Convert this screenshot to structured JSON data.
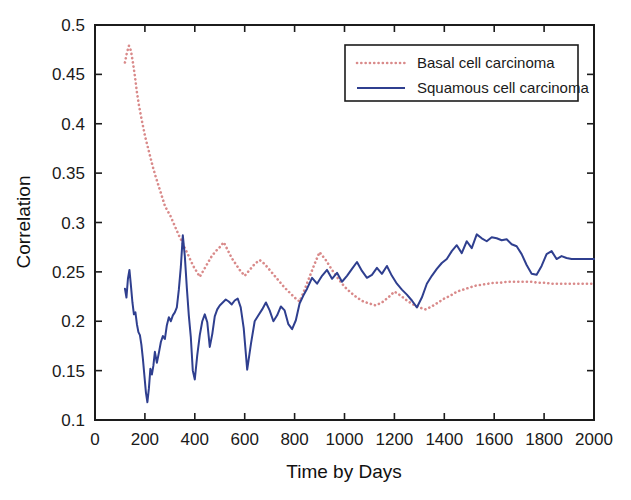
{
  "chart_data": {
    "type": "line",
    "title": "",
    "xlabel": "Time by Days",
    "ylabel": "Correlation",
    "xlim": [
      0,
      2000
    ],
    "ylim": [
      0.1,
      0.5
    ],
    "xticks": [
      0,
      200,
      400,
      600,
      800,
      1000,
      1200,
      1400,
      1600,
      1800,
      2000
    ],
    "xtick_labels": [
      "0",
      "200",
      "400",
      "600",
      "800",
      "1000",
      "1200",
      "1400",
      "1600",
      "1800",
      "2000"
    ],
    "yticks": [
      0.1,
      0.15,
      0.2,
      0.25,
      0.3,
      0.35,
      0.4,
      0.45,
      0.5
    ],
    "ytick_labels": [
      "0.1",
      "0.15",
      "0.2",
      "0.25",
      "0.3",
      "0.35",
      "0.4",
      "0.45",
      "0.5"
    ],
    "grid": false,
    "legend_position": "top-right",
    "series": [
      {
        "name": "Basal cell carcinoma",
        "color": "#d98a8a",
        "style": "dotted",
        "x": [
          120,
          128,
          136,
          144,
          152,
          160,
          168,
          176,
          184,
          192,
          200,
          210,
          220,
          230,
          240,
          250,
          260,
          270,
          280,
          290,
          300,
          312,
          324,
          336,
          348,
          360,
          372,
          384,
          396,
          408,
          420,
          436,
          452,
          468,
          484,
          500,
          516,
          532,
          548,
          564,
          580,
          600,
          620,
          640,
          660,
          680,
          700,
          720,
          740,
          760,
          780,
          800,
          820,
          840,
          860,
          880,
          900,
          925,
          950,
          975,
          1000,
          1025,
          1050,
          1075,
          1100,
          1125,
          1150,
          1175,
          1200,
          1225,
          1250,
          1275,
          1300,
          1325,
          1350,
          1375,
          1400,
          1425,
          1450,
          1475,
          1500,
          1525,
          1550,
          1575,
          1600,
          1625,
          1650,
          1675,
          1700,
          1725,
          1750,
          1775,
          1800,
          1830,
          1860,
          1890,
          1920,
          1950,
          1980,
          2000
        ],
        "y": [
          0.462,
          0.472,
          0.479,
          0.474,
          0.462,
          0.448,
          0.432,
          0.419,
          0.408,
          0.398,
          0.388,
          0.378,
          0.368,
          0.358,
          0.349,
          0.341,
          0.333,
          0.325,
          0.317,
          0.312,
          0.308,
          0.301,
          0.294,
          0.287,
          0.281,
          0.274,
          0.268,
          0.261,
          0.255,
          0.25,
          0.245,
          0.252,
          0.259,
          0.266,
          0.271,
          0.275,
          0.28,
          0.272,
          0.264,
          0.258,
          0.252,
          0.246,
          0.252,
          0.258,
          0.262,
          0.258,
          0.252,
          0.246,
          0.24,
          0.234,
          0.229,
          0.224,
          0.22,
          0.232,
          0.245,
          0.258,
          0.27,
          0.262,
          0.252,
          0.243,
          0.235,
          0.229,
          0.224,
          0.22,
          0.218,
          0.216,
          0.219,
          0.224,
          0.23,
          0.226,
          0.221,
          0.217,
          0.214,
          0.212,
          0.215,
          0.219,
          0.223,
          0.226,
          0.23,
          0.232,
          0.234,
          0.236,
          0.237,
          0.238,
          0.239,
          0.239,
          0.24,
          0.24,
          0.24,
          0.24,
          0.24,
          0.239,
          0.239,
          0.238,
          0.238,
          0.238,
          0.238,
          0.238,
          0.238,
          0.238
        ]
      },
      {
        "name": "Squamous cell carcinoma",
        "color": "#2f3f8f",
        "style": "solid",
        "x": [
          120,
          126,
          132,
          138,
          144,
          150,
          156,
          162,
          168,
          174,
          180,
          186,
          192,
          198,
          204,
          210,
          216,
          222,
          228,
          234,
          240,
          248,
          256,
          264,
          272,
          280,
          288,
          296,
          304,
          312,
          320,
          328,
          336,
          344,
          352,
          360,
          368,
          376,
          384,
          392,
          400,
          410,
          420,
          430,
          440,
          450,
          460,
          470,
          480,
          490,
          500,
          512,
          524,
          536,
          548,
          560,
          572,
          584,
          596,
          610,
          625,
          640,
          655,
          670,
          685,
          700,
          715,
          730,
          745,
          760,
          775,
          790,
          805,
          820,
          835,
          850,
          870,
          890,
          910,
          930,
          950,
          970,
          990,
          1010,
          1030,
          1050,
          1070,
          1090,
          1110,
          1130,
          1150,
          1170,
          1190,
          1210,
          1230,
          1250,
          1270,
          1290,
          1310,
          1330,
          1350,
          1370,
          1390,
          1410,
          1430,
          1450,
          1470,
          1490,
          1510,
          1530,
          1550,
          1570,
          1590,
          1610,
          1630,
          1650,
          1670,
          1690,
          1710,
          1730,
          1750,
          1770,
          1790,
          1810,
          1830,
          1850,
          1870,
          1890,
          1910,
          1930,
          1950,
          1970,
          2000
        ],
        "y": [
          0.233,
          0.224,
          0.243,
          0.252,
          0.236,
          0.219,
          0.207,
          0.209,
          0.197,
          0.189,
          0.186,
          0.176,
          0.162,
          0.145,
          0.128,
          0.118,
          0.132,
          0.152,
          0.146,
          0.155,
          0.169,
          0.158,
          0.168,
          0.179,
          0.185,
          0.182,
          0.196,
          0.204,
          0.2,
          0.206,
          0.209,
          0.214,
          0.232,
          0.255,
          0.287,
          0.266,
          0.234,
          0.206,
          0.184,
          0.15,
          0.141,
          0.166,
          0.186,
          0.2,
          0.207,
          0.199,
          0.174,
          0.187,
          0.205,
          0.212,
          0.216,
          0.219,
          0.222,
          0.22,
          0.217,
          0.221,
          0.223,
          0.214,
          0.193,
          0.151,
          0.177,
          0.2,
          0.206,
          0.212,
          0.219,
          0.211,
          0.2,
          0.206,
          0.215,
          0.211,
          0.197,
          0.192,
          0.201,
          0.218,
          0.226,
          0.233,
          0.244,
          0.238,
          0.246,
          0.252,
          0.243,
          0.249,
          0.24,
          0.246,
          0.253,
          0.26,
          0.251,
          0.244,
          0.247,
          0.254,
          0.248,
          0.256,
          0.246,
          0.238,
          0.232,
          0.227,
          0.221,
          0.214,
          0.224,
          0.238,
          0.246,
          0.253,
          0.259,
          0.263,
          0.271,
          0.277,
          0.269,
          0.281,
          0.274,
          0.288,
          0.284,
          0.281,
          0.285,
          0.284,
          0.282,
          0.283,
          0.278,
          0.276,
          0.268,
          0.257,
          0.248,
          0.247,
          0.256,
          0.268,
          0.271,
          0.263,
          0.266,
          0.264,
          0.263,
          0.263,
          0.263,
          0.263,
          0.263
        ]
      }
    ]
  },
  "legend": {
    "entries": [
      {
        "label": "Basal cell carcinoma",
        "marker": "dotted-line-swatch"
      },
      {
        "label": "Squamous cell carcinoma",
        "marker": "solid-line-swatch"
      }
    ]
  },
  "colors": {
    "basal": "#d98a8a",
    "squamous": "#2f3f8f",
    "axis": "#1c1c1c",
    "background": "#ffffff"
  }
}
